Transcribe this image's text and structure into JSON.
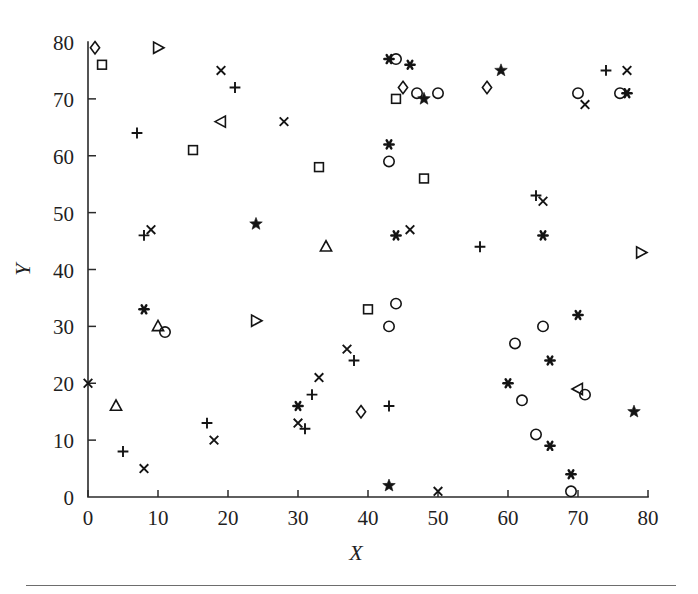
{
  "figure": {
    "background_color": "#ffffff",
    "ink_color": "#141414",
    "has_bottom_rule": true
  },
  "axes": {
    "x_title": "X",
    "y_title": "Y",
    "x_ticks": [
      "0",
      "10",
      "20",
      "30",
      "40",
      "50",
      "60",
      "70",
      "80"
    ],
    "y_ticks": [
      "0",
      "10",
      "20",
      "30",
      "40",
      "50",
      "60",
      "70",
      "80"
    ],
    "x_tick_values": [
      0,
      10,
      20,
      30,
      40,
      50,
      60,
      70,
      80
    ],
    "y_tick_values": [
      0,
      10,
      20,
      30,
      40,
      50,
      60,
      70,
      80
    ],
    "xlim": [
      0,
      80
    ],
    "ylim": [
      0,
      80
    ],
    "grid": false,
    "spines": [
      "left",
      "bottom"
    ]
  },
  "chart_data": {
    "type": "scatter",
    "title": "",
    "xlabel": "X",
    "ylabel": "Y",
    "xlim": [
      0,
      80
    ],
    "ylim": [
      0,
      80
    ],
    "grid": false,
    "legend": "none",
    "marker_styles": [
      "diamond",
      "square",
      "triangle-right",
      "triangle-left",
      "triangle-up",
      "circle",
      "plus",
      "cross",
      "star",
      "asterisk"
    ],
    "series": [
      {
        "name": "diamond",
        "marker": "diamond",
        "filled": false,
        "points": [
          [
            1,
            79
          ],
          [
            39,
            15
          ],
          [
            45,
            72
          ],
          [
            57,
            72
          ]
        ]
      },
      {
        "name": "square",
        "marker": "square",
        "filled": false,
        "points": [
          [
            2,
            76
          ],
          [
            15,
            61
          ],
          [
            33,
            58
          ],
          [
            40,
            33
          ],
          [
            44,
            70
          ],
          [
            48,
            56
          ]
        ]
      },
      {
        "name": "triangle-right",
        "marker": "triangle-right",
        "filled": false,
        "points": [
          [
            10,
            79
          ],
          [
            24,
            31
          ],
          [
            79,
            43
          ]
        ]
      },
      {
        "name": "triangle-left",
        "marker": "triangle-left",
        "filled": false,
        "points": [
          [
            19,
            66
          ],
          [
            70,
            19
          ]
        ]
      },
      {
        "name": "triangle-up",
        "marker": "triangle-up",
        "filled": false,
        "points": [
          [
            4,
            16
          ],
          [
            10,
            30
          ],
          [
            34,
            44
          ]
        ]
      },
      {
        "name": "circle",
        "marker": "circle",
        "filled": false,
        "points": [
          [
            11,
            29
          ],
          [
            43,
            30
          ],
          [
            43,
            59
          ],
          [
            44,
            77
          ],
          [
            44,
            34
          ],
          [
            47,
            71
          ],
          [
            50,
            71
          ],
          [
            61,
            27
          ],
          [
            62,
            17
          ],
          [
            64,
            11
          ],
          [
            65,
            30
          ],
          [
            69,
            1
          ],
          [
            70,
            71
          ],
          [
            71,
            18
          ],
          [
            76,
            71
          ]
        ]
      },
      {
        "name": "plus",
        "marker": "plus",
        "filled": false,
        "points": [
          [
            5,
            8
          ],
          [
            7,
            64
          ],
          [
            8,
            46
          ],
          [
            17,
            13
          ],
          [
            21,
            72
          ],
          [
            31,
            12
          ],
          [
            32,
            18
          ],
          [
            38,
            24
          ],
          [
            43,
            16
          ],
          [
            56,
            44
          ],
          [
            64,
            53
          ],
          [
            74,
            75
          ]
        ]
      },
      {
        "name": "cross",
        "marker": "cross",
        "filled": false,
        "points": [
          [
            0,
            20
          ],
          [
            8,
            5
          ],
          [
            9,
            47
          ],
          [
            18,
            10
          ],
          [
            19,
            75
          ],
          [
            28,
            66
          ],
          [
            30,
            13
          ],
          [
            33,
            21
          ],
          [
            37,
            26
          ],
          [
            46,
            47
          ],
          [
            50,
            1
          ],
          [
            65,
            52
          ],
          [
            71,
            69
          ],
          [
            77,
            75
          ]
        ]
      },
      {
        "name": "star",
        "marker": "star",
        "filled": true,
        "points": [
          [
            24,
            48
          ],
          [
            43,
            2
          ],
          [
            48,
            70
          ],
          [
            59,
            75
          ],
          [
            78,
            15
          ]
        ]
      },
      {
        "name": "asterisk",
        "marker": "asterisk",
        "filled": true,
        "points": [
          [
            8,
            33
          ],
          [
            30,
            16
          ],
          [
            43,
            77
          ],
          [
            43,
            62
          ],
          [
            44,
            46
          ],
          [
            46,
            76
          ],
          [
            60,
            20
          ],
          [
            65,
            46
          ],
          [
            66,
            24
          ],
          [
            66,
            9
          ],
          [
            69,
            4
          ],
          [
            70,
            32
          ],
          [
            77,
            71
          ]
        ]
      }
    ]
  }
}
